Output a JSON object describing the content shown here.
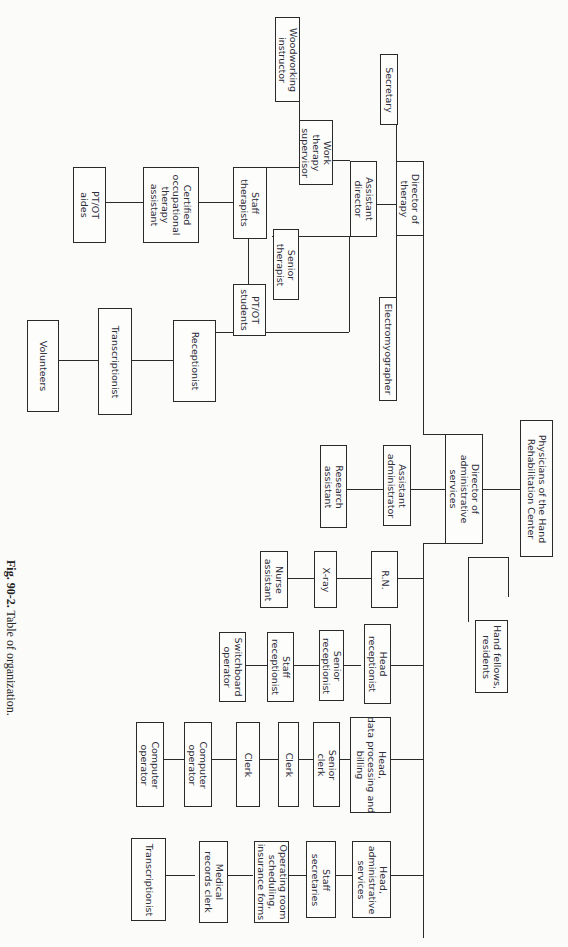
{
  "figure": {
    "caption_label": "Fig. 90-2.",
    "caption_text": " Table of organization."
  },
  "nodes": {
    "physicians": "Physicians of the Hand\nRehabilitation Center",
    "hand_fellows": "Hand fellows,\nresidents",
    "director_therapy": "Director of\ntherapy",
    "secretary": "Secretary",
    "electromyographer": "Electromyographer",
    "assistant_director": "Assistant\ndirector",
    "work_therapy_supervisor": "Work\ntherapy\nsupervisor",
    "woodworking_instructor": "Woodworking\ninstructor",
    "staff_therapists": "Staff\ntherapists",
    "senior_therapist": "Senior\ntherapist",
    "pt_ot_students": "PT/OT\nstudents",
    "cota": "Certified\noccupational\ntherapy\nassistant",
    "pt_ot_aides": "PT/OT\naides",
    "receptionist": "Receptionist",
    "transcriptionist_1": "Transcriptionist",
    "volunteers": "Volunteers",
    "director_admin": "Director of\nadministrative\nservices",
    "assistant_administrator": "Assistant\nadministrator",
    "research_assistant": "Research\nassistant",
    "rn": "R.N.",
    "xray": "X-ray",
    "nurse_assistant": "Nurse\nassistant",
    "head_receptionist": "Head\nreceptionist",
    "senior_receptionist": "Senior\nreceptionist",
    "staff_receptionist": "Staff\nreceptionist",
    "switchboard_operator": "Switchboard\noperator",
    "head_data_processing": "Head,\ndata processing and\nbilling",
    "senior_clerk": "Senior\nclerk",
    "clerk_1": "Clerk",
    "clerk_2": "Clerk",
    "computer_operator_1": "Computer\noperator",
    "computer_operator_2": "Computer\noperator",
    "head_admin_services": "Head,\nadministrative\nservices",
    "staff_secretaries": "Staff\nsecretaries",
    "operating_room": "Operating room\nscheduling,\ninsurance forms",
    "medical_records_clerk": "Medical\nrecords clerk",
    "transcriptionist_2": "Transcriptionist"
  }
}
